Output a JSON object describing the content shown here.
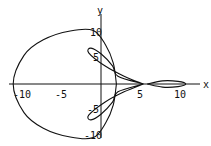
{
  "chart_data": {
    "type": "line",
    "title": "",
    "xlabel": "x",
    "ylabel": "y",
    "x_ticks": [
      -10,
      -5,
      5,
      10
    ],
    "y_ticks": [
      10,
      5,
      -5,
      -10
    ],
    "xlim": [
      -12,
      13
    ],
    "ylim": [
      -11,
      12
    ],
    "grid": false,
    "legend": "none",
    "series": [
      {
        "name": "outer loop",
        "points": [
          [
            2,
            0
          ],
          [
            1.6,
            4
          ],
          [
            0.6,
            7.5
          ],
          [
            -1,
            10.3
          ],
          [
            -4,
            10.2
          ],
          [
            -7.5,
            8.5
          ],
          [
            -10,
            5.5
          ],
          [
            -11.4,
            0
          ],
          [
            -10,
            -5.5
          ],
          [
            -7.5,
            -8.5
          ],
          [
            -4,
            -10.2
          ],
          [
            -1,
            -10.3
          ],
          [
            0.6,
            -7.5
          ],
          [
            1.6,
            -4
          ],
          [
            2,
            0
          ]
        ]
      },
      {
        "name": "upper petal",
        "points": [
          [
            5.5,
            0
          ],
          [
            3,
            1.5
          ],
          [
            0.5,
            3.5
          ],
          [
            -1.6,
            6
          ],
          [
            -1.3,
            6.9
          ],
          [
            0,
            5.8
          ],
          [
            1.5,
            3.5
          ],
          [
            2.2,
            1.5
          ],
          [
            5.5,
            0
          ]
        ]
      },
      {
        "name": "lower petal",
        "points": [
          [
            5.5,
            0
          ],
          [
            3,
            -1.5
          ],
          [
            0.5,
            -3.5
          ],
          [
            -1.6,
            -6
          ],
          [
            -1.3,
            -6.9
          ],
          [
            0,
            -5.8
          ],
          [
            1.5,
            -3.5
          ],
          [
            2.2,
            -1.5
          ],
          [
            5.5,
            0
          ]
        ]
      },
      {
        "name": "right loop",
        "points": [
          [
            6,
            0
          ],
          [
            8,
            0.6
          ],
          [
            10,
            0.5
          ],
          [
            11,
            0
          ],
          [
            10,
            -0.5
          ],
          [
            8,
            -0.6
          ],
          [
            6,
            0
          ]
        ]
      }
    ]
  },
  "axes": {
    "x_label": "x",
    "y_label": "y",
    "x_tick_labels": [
      "-10",
      "-5",
      "5",
      "10"
    ],
    "y_tick_labels": [
      "10",
      "5",
      "-5",
      "-10"
    ]
  }
}
